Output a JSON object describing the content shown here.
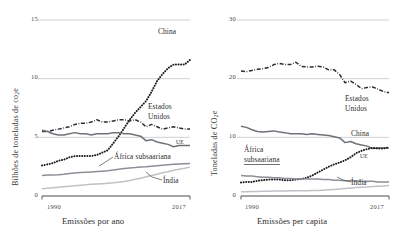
{
  "figure": {
    "background": "#ffffff",
    "panels": [
      "left",
      "right"
    ]
  },
  "colors": {
    "grid": "#bfc4cb",
    "axis": "#4a4a4a",
    "china": "#1c1c1c",
    "usa": "#2e2e2e",
    "eu": "#6d7278",
    "africa": "#8a8f95",
    "india": "#bdc2c7",
    "text": "#2b2b2b"
  },
  "left": {
    "ylabel": "Bilhões de toneladas de co",
    "ylabel_sub": "2",
    "ylabel_tail": "e",
    "yticks": [
      "0",
      "5",
      "10",
      "15"
    ],
    "xticks": [
      "1990",
      "2017"
    ],
    "xtitle": "Emissões por ano",
    "labels": {
      "china": "China",
      "usa_line1": "Estados",
      "usa_line2": "Unidos",
      "eu": "UE",
      "africa": "África subsaariana",
      "india": "Índia"
    }
  },
  "right": {
    "ylabel": "Toneladas de CO",
    "ylabel_sub": "2",
    "ylabel_tail": "e",
    "yticks": [
      "0",
      "10",
      "20",
      "30"
    ],
    "xticks": [
      "1990",
      "2017"
    ],
    "xtitle": "Emissões per capita",
    "labels": {
      "china": "China",
      "usa_line1": "Estados",
      "usa_line2": "Unidos",
      "eu": "UE",
      "africa_line1": "África",
      "africa_line2": "subsaariana",
      "india": "Índia"
    }
  },
  "chart_data": [
    {
      "type": "line",
      "panel": "left",
      "title": "",
      "xlabel": "Emissões por ano",
      "ylabel": "Bilhões de toneladas de co2e",
      "xlim": [
        1990,
        2017
      ],
      "ylim": [
        0,
        15
      ],
      "yticks": [
        0,
        5,
        10,
        15
      ],
      "xticks": [
        1990,
        2017
      ],
      "grid": "horizontal",
      "legend": "inline-annotations",
      "x": [
        1990,
        1991,
        1992,
        1993,
        1994,
        1995,
        1996,
        1997,
        1998,
        1999,
        2000,
        2001,
        2002,
        2003,
        2004,
        2005,
        2006,
        2007,
        2008,
        2009,
        2010,
        2011,
        2012,
        2013,
        2014,
        2015,
        2016,
        2017
      ],
      "series": [
        {
          "name": "China",
          "style": "dotted",
          "color": "#1c1c1c",
          "values": [
            2.6,
            2.7,
            2.8,
            3.0,
            3.1,
            3.3,
            3.4,
            3.4,
            3.4,
            3.4,
            3.5,
            3.7,
            3.9,
            4.5,
            5.1,
            5.8,
            6.5,
            7.1,
            7.6,
            8.1,
            8.9,
            9.8,
            10.4,
            10.9,
            11.2,
            11.2,
            11.2,
            11.6
          ]
        },
        {
          "name": "Estados Unidos",
          "style": "dash-dot",
          "color": "#2e2e2e",
          "values": [
            5.5,
            5.5,
            5.6,
            5.7,
            5.8,
            5.9,
            6.1,
            6.2,
            6.2,
            6.3,
            6.5,
            6.3,
            6.3,
            6.4,
            6.5,
            6.5,
            6.4,
            6.5,
            6.3,
            5.9,
            6.1,
            5.9,
            5.7,
            5.8,
            5.9,
            5.8,
            5.7,
            5.7
          ]
        },
        {
          "name": "UE",
          "style": "solid",
          "color": "#6d7278",
          "values": [
            5.6,
            5.5,
            5.3,
            5.2,
            5.2,
            5.3,
            5.4,
            5.3,
            5.3,
            5.2,
            5.3,
            5.3,
            5.3,
            5.4,
            5.4,
            5.3,
            5.3,
            5.2,
            5.1,
            4.7,
            4.8,
            4.6,
            4.5,
            4.4,
            4.2,
            4.3,
            4.3,
            4.3
          ]
        },
        {
          "name": "África subsaariana",
          "style": "solid",
          "color": "#8a8f95",
          "values": [
            1.75,
            1.78,
            1.8,
            1.82,
            1.86,
            1.92,
            1.96,
            2.0,
            2.02,
            2.05,
            2.08,
            2.12,
            2.16,
            2.22,
            2.28,
            2.34,
            2.38,
            2.42,
            2.48,
            2.5,
            2.54,
            2.58,
            2.62,
            2.66,
            2.7,
            2.72,
            2.74,
            2.76
          ]
        },
        {
          "name": "Índia",
          "style": "solid",
          "color": "#bdc2c7",
          "values": [
            0.62,
            0.66,
            0.7,
            0.74,
            0.78,
            0.83,
            0.88,
            0.92,
            0.95,
            1.0,
            1.03,
            1.05,
            1.08,
            1.12,
            1.18,
            1.24,
            1.32,
            1.42,
            1.52,
            1.64,
            1.75,
            1.86,
            1.98,
            2.06,
            2.2,
            2.28,
            2.36,
            2.46
          ]
        }
      ]
    },
    {
      "type": "line",
      "panel": "right",
      "title": "",
      "xlabel": "Emissões per capita",
      "ylabel": "Toneladas de CO2e",
      "xlim": [
        1990,
        2017
      ],
      "ylim": [
        0,
        30
      ],
      "yticks": [
        0,
        10,
        20,
        30
      ],
      "xticks": [
        1990,
        2017
      ],
      "grid": "horizontal",
      "legend": "inline-annotations",
      "x": [
        1990,
        1991,
        1992,
        1993,
        1994,
        1995,
        1996,
        1997,
        1998,
        1999,
        2000,
        2001,
        2002,
        2003,
        2004,
        2005,
        2006,
        2007,
        2008,
        2009,
        2010,
        2011,
        2012,
        2013,
        2014,
        2015,
        2016,
        2017
      ],
      "series": [
        {
          "name": "Estados Unidos",
          "style": "dash-dot",
          "color": "#2e2e2e",
          "values": [
            21.3,
            21.2,
            21.4,
            21.6,
            21.7,
            21.9,
            22.4,
            22.6,
            22.4,
            22.4,
            22.8,
            22.1,
            22.0,
            22.0,
            22.1,
            22.0,
            21.5,
            21.5,
            20.7,
            19.3,
            19.6,
            19.0,
            18.3,
            18.5,
            18.6,
            18.2,
            17.8,
            17.6
          ]
        },
        {
          "name": "UE",
          "style": "solid",
          "color": "#6d7278",
          "values": [
            11.9,
            11.7,
            11.3,
            11.0,
            10.9,
            11.0,
            11.1,
            10.9,
            10.8,
            10.6,
            10.6,
            10.6,
            10.5,
            10.6,
            10.5,
            10.4,
            10.3,
            10.1,
            9.9,
            9.1,
            9.3,
            8.9,
            8.7,
            8.5,
            8.1,
            8.2,
            8.2,
            8.2
          ]
        },
        {
          "name": "China",
          "style": "dotted",
          "color": "#1c1c1c",
          "values": [
            2.3,
            2.4,
            2.4,
            2.6,
            2.7,
            2.8,
            2.8,
            2.8,
            2.7,
            2.7,
            2.8,
            2.9,
            3.1,
            3.5,
            4.0,
            4.5,
            5.0,
            5.4,
            5.7,
            6.1,
            6.6,
            7.3,
            7.7,
            8.0,
            8.2,
            8.1,
            8.1,
            8.3
          ]
        },
        {
          "name": "África subsaariana",
          "style": "solid",
          "color": "#8a8f95",
          "values": [
            3.5,
            3.4,
            3.4,
            3.3,
            3.2,
            3.2,
            3.1,
            3.1,
            3.0,
            3.0,
            2.9,
            2.9,
            2.9,
            2.9,
            2.9,
            2.8,
            2.8,
            2.7,
            2.7,
            2.6,
            2.6,
            2.6,
            2.5,
            2.5,
            2.5,
            2.4,
            2.4,
            2.4
          ]
        },
        {
          "name": "Índia",
          "style": "solid",
          "color": "#bdc2c7",
          "values": [
            0.72,
            0.74,
            0.76,
            0.78,
            0.8,
            0.82,
            0.84,
            0.86,
            0.86,
            0.88,
            0.88,
            0.88,
            0.9,
            0.92,
            0.95,
            1.0,
            1.06,
            1.12,
            1.2,
            1.28,
            1.35,
            1.43,
            1.5,
            1.54,
            1.62,
            1.66,
            1.72,
            1.78
          ]
        }
      ]
    }
  ]
}
